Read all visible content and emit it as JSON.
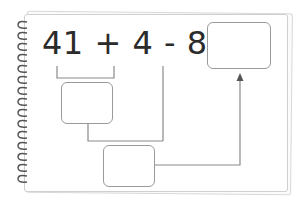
{
  "equation": {
    "terms": [
      "41",
      "+",
      "4",
      "-",
      "8",
      "="
    ],
    "text": "41 + 4 - 8 ="
  },
  "boxes": {
    "answer": "",
    "step1": "",
    "step2": ""
  },
  "icons": {
    "spiral": "notebook-spiral-binding",
    "arrow": "arrow-up-icon"
  },
  "colors": {
    "text": "#2b2b2b",
    "line": "#8a8a8a",
    "box_border": "#9a9a9a"
  }
}
